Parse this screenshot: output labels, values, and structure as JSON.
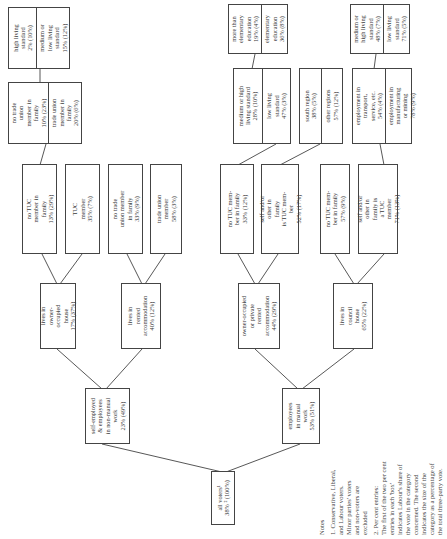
{
  "diagram": {
    "root": {
      "label": "all voters¹\n38% ²  (100%)"
    },
    "level1": [
      {
        "id": "nonmanual",
        "label": "self-employed\n& employees\nin non-manual\nwork\n23% (49%)"
      },
      {
        "id": "manual",
        "label": "employees\nin manual\nwork\n53% (51%)"
      }
    ],
    "level2": [
      {
        "id": "owner",
        "label": "lives in\nowner-\noccupied\nhouse\n17% (37%)"
      },
      {
        "id": "rented",
        "label": "lives in\nrented\naccommodation\n40% (12%)"
      },
      {
        "id": "owner_private",
        "label": "owner-occupied\nor private\nrented\naccommodation\n44% (29%)"
      },
      {
        "id": "council",
        "label": "lives in\ncouncil\nhouse\n65% (22%)"
      }
    ],
    "level3": [
      {
        "id": "no_tuc_family",
        "label": "no TUC\nmember in\nfamily\n13% (29%)"
      },
      {
        "id": "tuc_member",
        "label": "TUC\nmember\n35% (7%)"
      },
      {
        "id": "no_tu_family",
        "label": "no trade\nunion member\nin family\n33% (9%)"
      },
      {
        "id": "tu_member",
        "label": "trade union\nmember\n58% (3%)"
      },
      {
        "id": "no_tuc_mem_family",
        "label": "no TUC mem-\nber in family\n33% (12%)"
      },
      {
        "id": "self_tuc",
        "label": "self and/or\nother in\nfamily\nis TUC mem-\nber\n52% (17%)"
      },
      {
        "id": "no_tuc_family_council",
        "label": "no TUC mem-\nber in family\n57% (9%)"
      },
      {
        "id": "self_tuc_council",
        "label": "self and/or\nother in\nfamily is\na TUC\nmember\n71% (13%)"
      }
    ],
    "level4": [
      {
        "id": "union_pair",
        "cells": [
          "no trade\nunion\nmember in\nfamily\n10% (23%)",
          "trade union\nmember in\nfamily\n20% (6%)"
        ]
      },
      {
        "id": "living_pair",
        "cells": [
          "medium or high\nliving standard\n28% (10%)",
          "low living\nstandard\n47% (3%)"
        ]
      },
      {
        "id": "region_pair",
        "cells": [
          "south region\n38% (5%)",
          "other regions\n57% (12%)"
        ]
      },
      {
        "id": "employment_pair",
        "cells": [
          "employment in\ntransport,\nservice, etc.\n54% (4%)",
          "employment in\nmanufacturing\nor mining\n78% (9%)"
        ]
      }
    ],
    "level5": [
      {
        "id": "living_std_pair",
        "cells": [
          "high living\nstandard\n2% (10%)",
          "medium or\nlow living\nstandard\n15% (12%)"
        ]
      },
      {
        "id": "education_pair",
        "cells": [
          "more than\nelementary\neducation\n19% (4%)",
          "elementary\neducation\n36% (8%)"
        ]
      },
      {
        "id": "living_std_pair2",
        "cells": [
          "medium or\nhigh living\nstandard\n48% (7%)",
          "low living\nstandard\n71% (5%)"
        ]
      }
    ]
  },
  "notes": {
    "heading": "Notes",
    "items": [
      "1. Conservative, Liberal,\nand Labour voters.\nMinor parties' voters\nand non-voters are\nexcluded",
      "2. Per cent entries:\nThe first of the two per cent\nentries in each 'box'\nindicates Labour's share of\nthe vote in the category\nconcerned. The second\nindicates the size of the\ncategory as a percentage of\nthe total three-party vote."
    ]
  }
}
